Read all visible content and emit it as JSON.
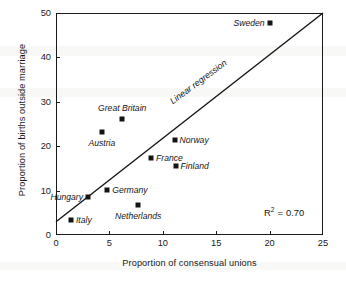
{
  "chart_data": {
    "type": "scatter",
    "title": "",
    "xlabel": "Proportion of consensual unions",
    "ylabel": "Proportion of births outside marriage",
    "xlim": [
      0,
      25
    ],
    "ylim": [
      0,
      50
    ],
    "xticks": [
      0,
      5,
      10,
      15,
      20,
      25
    ],
    "yticks": [
      0,
      10,
      20,
      30,
      40,
      50
    ],
    "grid": false,
    "legend": "none",
    "points": [
      {
        "label": "Italy",
        "x": 1.4,
        "y": 3.4,
        "label_pos": "right"
      },
      {
        "label": "Hungary",
        "x": 3.0,
        "y": 8.6,
        "label_pos": "left"
      },
      {
        "label": "Austria",
        "x": 4.3,
        "y": 23.3,
        "label_pos": "below"
      },
      {
        "label": "Germany",
        "x": 4.8,
        "y": 10.1,
        "label_pos": "right"
      },
      {
        "label": "Great Britain",
        "x": 6.2,
        "y": 26.1,
        "label_pos": "above"
      },
      {
        "label": "Netherlands",
        "x": 7.7,
        "y": 6.8,
        "label_pos": "below"
      },
      {
        "label": "France",
        "x": 8.9,
        "y": 17.4,
        "label_pos": "right"
      },
      {
        "label": "Norway",
        "x": 11.1,
        "y": 21.4,
        "label_pos": "right"
      },
      {
        "label": "Finland",
        "x": 11.2,
        "y": 15.6,
        "label_pos": "right"
      },
      {
        "label": "Sweden",
        "x": 20.0,
        "y": 47.7,
        "label_pos": "left"
      }
    ],
    "regression": {
      "label": "Linear regression",
      "x_start": 0,
      "y_start": 3.0,
      "x_end": 25,
      "y_end": 50.0
    },
    "annotations": {
      "r_squared_symbol": "R",
      "r_squared_exponent": "2",
      "r_squared_equals": "=",
      "r_squared_value": "0.70"
    },
    "colors": {
      "marker": "#141414",
      "line": "#141414",
      "axis": "#1a1a1a",
      "background": "#ffffff"
    }
  }
}
